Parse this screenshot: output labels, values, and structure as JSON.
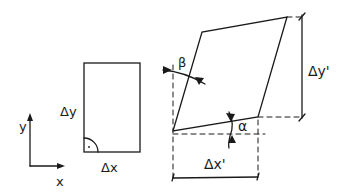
{
  "diagram": {
    "colors": {
      "stroke": "#1a1a1a",
      "background": "#ffffff"
    },
    "axes": {
      "x_label": "x",
      "y_label": "y"
    },
    "original_element": {
      "width_label": "Δx",
      "height_label": "Δy",
      "right_angle_marker": "·"
    },
    "deformed_element": {
      "width_label": "Δx'",
      "height_label": "Δy'",
      "angle_bottom_label": "α",
      "angle_left_label": "β"
    }
  }
}
